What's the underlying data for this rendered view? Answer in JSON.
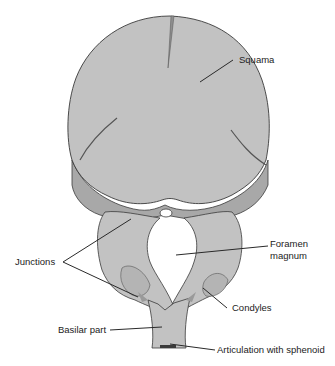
{
  "diagram": {
    "colors": {
      "bone_fill": "#c2c2c2",
      "junction_fill": "#a8a8a8",
      "outline": "#3a3a3a",
      "leader": "#2a2a2a",
      "text": "#222222"
    },
    "labels": [
      {
        "id": "squama",
        "text": "Squama"
      },
      {
        "id": "junctions",
        "text": "Junctions"
      },
      {
        "id": "foramen_magnum_1",
        "text": "Foramen"
      },
      {
        "id": "foramen_magnum_2",
        "text": "magnum"
      },
      {
        "id": "condyles",
        "text": "Condyles"
      },
      {
        "id": "basilar_part",
        "text": "Basilar part"
      },
      {
        "id": "articulation",
        "text": "Articulation with sphenoid"
      }
    ]
  }
}
